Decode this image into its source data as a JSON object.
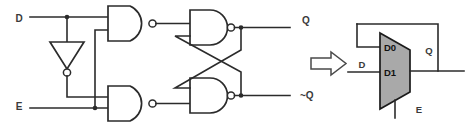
{
  "figure": {
    "colors": {
      "wire": "#2b2b2b",
      "gate_fill": "#ffffff",
      "mux_fill": "#a9a9a9",
      "arrow_stroke": "#4a4a4a",
      "background": "#ffffff"
    }
  },
  "gate_circuit": {
    "inputs": [
      {
        "name": "d-input",
        "label": "D"
      },
      {
        "name": "e-input",
        "label": "E"
      }
    ],
    "outputs": [
      {
        "name": "q-output",
        "label": "Q"
      },
      {
        "name": "q-bar-output",
        "label": "~Q"
      }
    ],
    "gates": [
      {
        "name": "inverter",
        "type": "NOT",
        "label": ""
      },
      {
        "name": "nand-top-left",
        "type": "NAND",
        "label": ""
      },
      {
        "name": "nand-bottom-left",
        "type": "NAND",
        "label": ""
      },
      {
        "name": "nand-top-right",
        "type": "NAND",
        "label": ""
      },
      {
        "name": "nand-bottom-right",
        "type": "NAND",
        "label": ""
      }
    ]
  },
  "equivalence_arrow": {
    "name": "equivalence-arrow",
    "glyph": "right-arrow"
  },
  "mux_symbol": {
    "name": "multiplexer",
    "ports": {
      "d0": "D0",
      "d1": "D1",
      "select": "E",
      "data_in": "D",
      "output": "Q"
    }
  }
}
